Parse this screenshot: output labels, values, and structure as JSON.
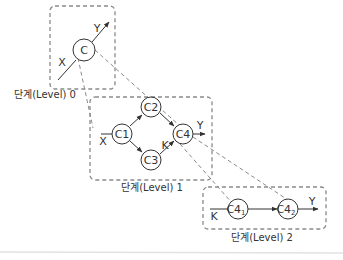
{
  "colors": {
    "line": "#333333",
    "dashed": "#8a8a8a",
    "node_fill": "#ffffff",
    "separator": "#e2e2e2"
  },
  "levels": [
    {
      "label": "단계(Level) 0"
    },
    {
      "label": "단계(Level) 1"
    },
    {
      "label": "단계(Level) 2"
    }
  ],
  "nodes": {
    "c": "C",
    "c1": "C1",
    "c2": "C2",
    "c3": "C3",
    "c4": "C4",
    "c41_main": "C4",
    "c41_sub": "1",
    "c42_main": "C4",
    "c42_sub": "2"
  },
  "variables": {
    "level0_x": "X",
    "level0_y": "Y",
    "level1_x": "X",
    "level1_y": "Y",
    "level1_k": "K",
    "level2_k": "K",
    "level2_y": "Y"
  }
}
